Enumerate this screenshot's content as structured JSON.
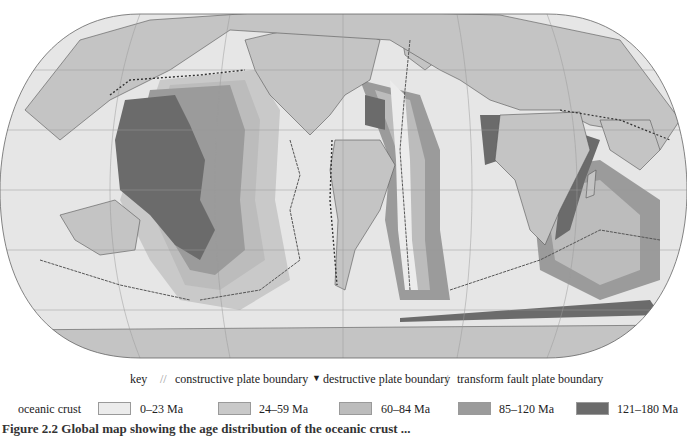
{
  "figure": {
    "caption_partial": "Figure 2.2  Global map showing the age distribution of the oceanic crust ..."
  },
  "key": {
    "label": "key",
    "boundaries": [
      {
        "symbol": "//",
        "label": "constructive plate boundary"
      },
      {
        "symbol": "▼",
        "label": "destructive plate boundary"
      },
      {
        "symbol": "/",
        "label": "transform fault plate boundary"
      }
    ]
  },
  "crust": {
    "label": "oceanic crust",
    "classes": [
      {
        "label": "0–23 Ma",
        "color": "#ececec"
      },
      {
        "label": "24–59 Ma",
        "color": "#c9c9c9"
      },
      {
        "label": "60–84 Ma",
        "color": "#bcbcbc"
      },
      {
        "label": "85–120 Ma",
        "color": "#9b9b9b"
      },
      {
        "label": "121–180 Ma",
        "color": "#6b6b6b"
      }
    ]
  },
  "colors": {
    "land": "#c4c4c4",
    "shelf": "#ffffff",
    "outline": "#555555",
    "graticule": "#9a9a9a"
  }
}
